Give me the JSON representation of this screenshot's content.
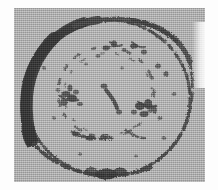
{
  "image": {
    "kind": "scanned-grayscale-micrograph",
    "subject_label": "circular cell-like body",
    "width_px": 218,
    "height_px": 190,
    "paper_margin_color": "#fdfdfd",
    "plate": {
      "x": 14,
      "y": 8,
      "width": 191,
      "height": 174,
      "background_color": "#a9a9a9",
      "texture": "halftone-dither-grain"
    },
    "tones": {
      "paper_white": "#fdfdfd",
      "plate_gray": "#a9a9a9",
      "mid_gray": "#8f8f8f",
      "dark_ink": "#3a3a3a",
      "deepest_ink": "#2b2b2b",
      "faint_ink": "#6e6e6e"
    },
    "outer_ring": {
      "label": "cell-boundary-ring",
      "center_x": 108,
      "center_y": 98,
      "radius_x": 82,
      "radius_y": 78,
      "description": "roughly circular outline, thick and solid along the upper-left arc, thinning into a broken beaded chain around the right and lower arcs",
      "thick_arc_start_deg": 150,
      "thick_arc_end_deg": 260,
      "thick_arc_max_width_px": 13,
      "thin_arc_width_px": 3
    },
    "inner_ring": {
      "label": "inner-granule-ring",
      "center_x": 106,
      "center_y": 92,
      "radius_x": 48,
      "radius_y": 45,
      "description": "faint broken inner circle formed by scattered dark granules and short dashes"
    },
    "granule_clusters": [
      {
        "name": "left-cluster",
        "x": 68,
        "y": 92,
        "density": "high"
      },
      {
        "name": "upper-center-specks",
        "x": 112,
        "y": 50,
        "density": "medium"
      },
      {
        "name": "center-dash",
        "x": 112,
        "y": 98,
        "density": "medium"
      },
      {
        "name": "right-cluster",
        "x": 150,
        "y": 110,
        "density": "high"
      },
      {
        "name": "lower-arc-chain",
        "x": 100,
        "y": 135,
        "density": "medium"
      },
      {
        "name": "upper-right-specks",
        "x": 158,
        "y": 72,
        "density": "low"
      }
    ],
    "edge_artifacts": {
      "right_scuff": "light vertical scuff band near right edge of plate",
      "bottom_fade": "plate tone lightens toward lower margin"
    }
  }
}
